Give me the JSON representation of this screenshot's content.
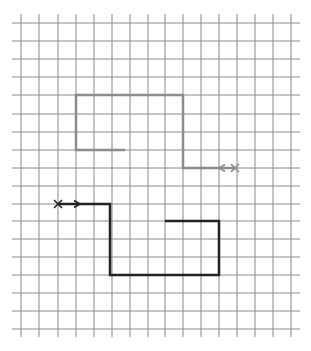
{
  "diagram": {
    "type": "grid-path-worksheet",
    "background": "#ffffff",
    "grid": {
      "color": "#8a8a8a",
      "vertical_lines_x": [
        21,
        39,
        58,
        76,
        94,
        112,
        130,
        148,
        165,
        183,
        201,
        219,
        237,
        255,
        273,
        291
      ],
      "vertical_extent_y": [
        14,
        337
      ],
      "horizontal_lines_y": [
        23,
        41,
        59,
        77,
        95,
        114,
        132,
        150,
        168,
        186,
        204,
        221,
        239,
        257,
        275,
        293,
        311,
        329
      ],
      "horizontal_extent_x": [
        12,
        300
      ]
    },
    "paths": [
      {
        "name": "gray-path",
        "color": "#8c8c8c",
        "width": 2.5,
        "points": [
          [
            125,
            150
          ],
          [
            76,
            150
          ],
          [
            76,
            95
          ],
          [
            183,
            95
          ],
          [
            183,
            168
          ],
          [
            235,
            168
          ]
        ],
        "start_marker": {
          "type": "x",
          "at": [
            235,
            168
          ]
        },
        "arrow": {
          "at": [
            219,
            168
          ],
          "direction": "left"
        }
      },
      {
        "name": "black-path",
        "color": "#222222",
        "width": 2.5,
        "points": [
          [
            58,
            204
          ],
          [
            110,
            204
          ],
          [
            110,
            275
          ],
          [
            219,
            275
          ],
          [
            219,
            221
          ],
          [
            165,
            221
          ]
        ],
        "start_marker": {
          "type": "x",
          "at": [
            58,
            204
          ]
        },
        "arrow": {
          "at": [
            80,
            204
          ],
          "direction": "right"
        }
      }
    ]
  }
}
